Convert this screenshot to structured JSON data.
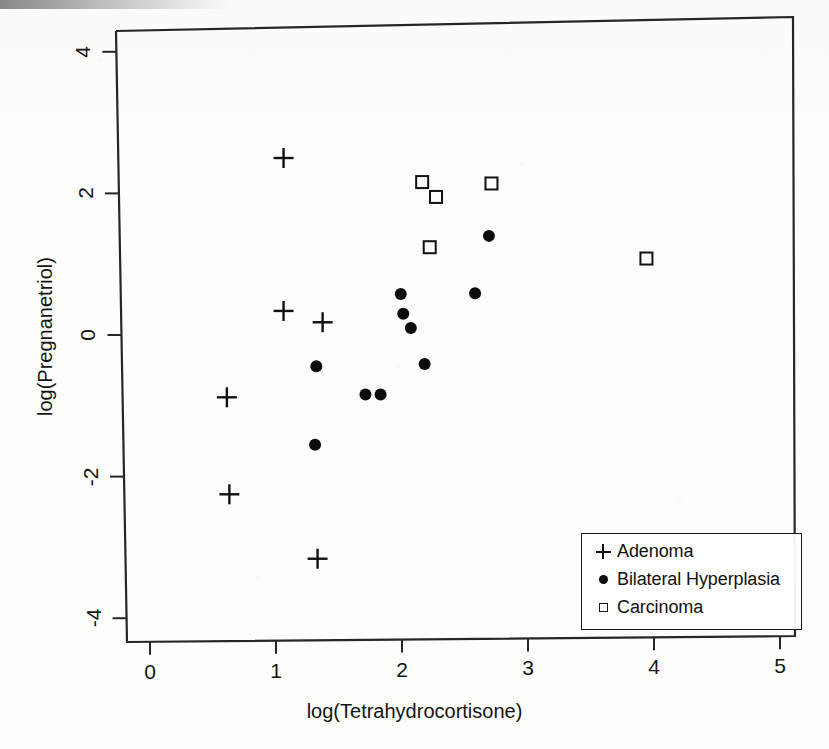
{
  "chart_data": {
    "type": "scatter",
    "title": "",
    "xlabel": "log(Tetrahydrocortisone)",
    "ylabel": "log(Pregnanetriol)",
    "xlim": [
      -0.2,
      5.2
    ],
    "ylim": [
      -4.45,
      4.4
    ],
    "xticks": [
      0,
      1,
      2,
      3,
      4,
      5
    ],
    "yticks": [
      -4,
      -2,
      0,
      2,
      4
    ],
    "xtick_labels": [
      "0",
      "1",
      "2",
      "3",
      "4",
      "5"
    ],
    "ytick_labels": [
      "-4",
      "-2",
      "0",
      "2",
      "4"
    ],
    "grid": false,
    "legend_position": "bottom-right",
    "series": [
      {
        "name": "Adenoma",
        "marker": "plus",
        "color": "#111111",
        "points": [
          {
            "x": 1.06,
            "y": 2.5
          },
          {
            "x": 1.06,
            "y": 0.34
          },
          {
            "x": 1.37,
            "y": 0.18
          },
          {
            "x": 0.61,
            "y": -0.88
          },
          {
            "x": 0.63,
            "y": -2.25
          },
          {
            "x": 1.33,
            "y": -3.16
          }
        ]
      },
      {
        "name": "Bilateral Hyperplasia",
        "marker": "filled-circle",
        "color": "#0c0c0c",
        "points": [
          {
            "x": 2.69,
            "y": 1.4
          },
          {
            "x": 2.58,
            "y": 0.59
          },
          {
            "x": 1.99,
            "y": 0.58
          },
          {
            "x": 2.01,
            "y": 0.3
          },
          {
            "x": 2.07,
            "y": 0.1
          },
          {
            "x": 1.32,
            "y": -0.44
          },
          {
            "x": 2.18,
            "y": -0.41
          },
          {
            "x": 1.71,
            "y": -0.84
          },
          {
            "x": 1.83,
            "y": -0.84
          },
          {
            "x": 1.31,
            "y": -1.55
          }
        ]
      },
      {
        "name": "Carcinoma",
        "marker": "open-square",
        "color": "#111111",
        "points": [
          {
            "x": 2.16,
            "y": 2.16
          },
          {
            "x": 2.71,
            "y": 2.14
          },
          {
            "x": 2.27,
            "y": 1.95
          },
          {
            "x": 2.22,
            "y": 1.24
          },
          {
            "x": 3.94,
            "y": 1.08
          }
        ]
      }
    ]
  },
  "legend": {
    "items": [
      {
        "label": "Adenoma",
        "marker": "plus-icon"
      },
      {
        "label": "Bilateral Hyperplasia",
        "marker": "filled-circle-icon"
      },
      {
        "label": "Carcinoma",
        "marker": "open-square-icon"
      }
    ]
  },
  "axes": {
    "x_title": "log(Tetrahydrocortisone)",
    "y_title": "log(Pregnanetriol)"
  }
}
